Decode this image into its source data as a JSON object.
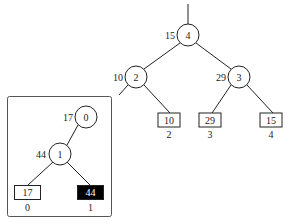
{
  "main_tree": {
    "root": {
      "id": "4",
      "weight": "15"
    },
    "internal": [
      {
        "id": "2",
        "weight": "10"
      },
      {
        "id": "3",
        "weight": "29"
      }
    ],
    "leaves": [
      {
        "value": "10",
        "index": "2"
      },
      {
        "value": "29",
        "index": "3"
      },
      {
        "value": "15",
        "index": "4"
      }
    ]
  },
  "inset_tree": {
    "root": {
      "id": "0",
      "weight": "17"
    },
    "internal": [
      {
        "id": "1",
        "weight": "44"
      }
    ],
    "leaves": [
      {
        "value": "17",
        "index": "0",
        "highlighted": false
      },
      {
        "value": "44",
        "index": "1",
        "highlighted": true
      }
    ]
  },
  "colors": {
    "stroke": "#222222",
    "highlight_fill": "#000000",
    "highlight_text": "#ffffff"
  }
}
